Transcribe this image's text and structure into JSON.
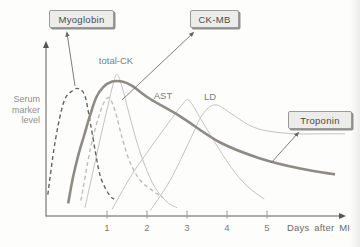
{
  "figure": {
    "background": "#fdfdfb",
    "axis_color": "#5d5d5d",
    "tick_color": "#9b9b9b",
    "tick_text_color": "#7c7c7c",
    "curve_label_color": "#7e7e7e",
    "callout_box_bg": "#ececea",
    "callout_box_border": "#9a9a9a"
  },
  "chart_data": {
    "type": "line",
    "title": "",
    "xlabel": "Days after MI",
    "ylabel": "Serum marker level",
    "x_ticks": [
      "1",
      "2",
      "3",
      "4",
      "5"
    ],
    "x_tick_days": [
      1,
      2,
      3,
      4,
      5
    ],
    "x_range_days": [
      -0.55,
      7.1
    ],
    "y_range_level_pct": [
      0,
      105
    ],
    "grid": false,
    "legend_position": "none",
    "series": [
      {
        "name": "total-CK",
        "style": "thin-solid",
        "color": "#c3c3c3",
        "width": 1,
        "dash": "",
        "inline_label": {
          "text": "total-CK",
          "px": [
            116,
            64
          ]
        },
        "points": [
          [
            0.45,
            5
          ],
          [
            0.65,
            30
          ],
          [
            0.85,
            55
          ],
          [
            1.02,
            75
          ],
          [
            1.15,
            90
          ],
          [
            1.25,
            97
          ],
          [
            1.38,
            88
          ],
          [
            1.55,
            70
          ],
          [
            1.75,
            50
          ],
          [
            1.95,
            34
          ],
          [
            2.2,
            19
          ],
          [
            2.5,
            9
          ],
          [
            2.75,
            5
          ]
        ]
      },
      {
        "name": "AST",
        "style": "thin-solid",
        "color": "#c3c3c3",
        "width": 1,
        "dash": "",
        "inline_label": {
          "text": "AST",
          "px": [
            163,
            99
          ]
        },
        "points": [
          [
            1.13,
            4
          ],
          [
            1.58,
            26
          ],
          [
            2.05,
            45
          ],
          [
            2.55,
            64
          ],
          [
            2.88,
            76
          ],
          [
            3.05,
            79
          ],
          [
            3.35,
            66
          ],
          [
            3.7,
            50
          ],
          [
            4.1,
            33
          ],
          [
            4.5,
            20
          ],
          [
            4.93,
            11
          ]
        ]
      },
      {
        "name": "LD",
        "style": "thin-solid",
        "color": "#c3c3c3",
        "width": 1,
        "dash": "",
        "inline_label": {
          "text": "LD",
          "px": [
            210,
            100
          ]
        },
        "points": [
          [
            2.08,
            3
          ],
          [
            2.58,
            24
          ],
          [
            3.08,
            52
          ],
          [
            3.38,
            69
          ],
          [
            3.7,
            76
          ],
          [
            4.1,
            70
          ],
          [
            4.55,
            62
          ],
          [
            5.0,
            58
          ],
          [
            5.7,
            56
          ],
          [
            6.3,
            56
          ],
          [
            6.95,
            56
          ]
        ]
      },
      {
        "name": "CK-MB",
        "style": "dashed-light",
        "color": "#bcbcbc",
        "width": 1.4,
        "dash": "4 3",
        "points": [
          [
            0.35,
            10
          ],
          [
            0.58,
            45
          ],
          [
            0.83,
            71
          ],
          [
            1.03,
            81
          ],
          [
            1.2,
            72
          ],
          [
            1.38,
            53
          ],
          [
            1.58,
            36
          ],
          [
            1.83,
            24
          ],
          [
            2.13,
            17
          ],
          [
            2.4,
            12
          ]
        ]
      },
      {
        "name": "Myoglobin",
        "style": "dashed-dark",
        "color": "#636363",
        "width": 1.4,
        "dash": "4 3",
        "points": [
          [
            -0.48,
            14
          ],
          [
            -0.3,
            50
          ],
          [
            -0.08,
            78
          ],
          [
            0.15,
            86
          ],
          [
            0.3,
            87
          ],
          [
            0.45,
            82
          ],
          [
            0.58,
            64
          ],
          [
            0.7,
            45
          ],
          [
            0.82,
            28
          ],
          [
            0.95,
            19
          ],
          [
            1.08,
            13
          ],
          [
            1.18,
            11
          ]
        ]
      },
      {
        "name": "Troponin",
        "style": "thick-solid",
        "color": "#8e8a86",
        "width": 2.6,
        "dash": "",
        "points": [
          [
            0.03,
            8
          ],
          [
            0.15,
            26
          ],
          [
            0.28,
            41
          ],
          [
            0.43,
            55
          ],
          [
            0.58,
            69
          ],
          [
            0.73,
            81
          ],
          [
            0.9,
            88
          ],
          [
            1.13,
            92
          ],
          [
            1.38,
            92
          ],
          [
            1.63,
            89
          ],
          [
            2.08,
            80
          ],
          [
            2.83,
            68
          ],
          [
            3.83,
            50
          ],
          [
            4.83,
            39
          ],
          [
            5.83,
            32
          ],
          [
            6.7,
            28
          ]
        ]
      }
    ],
    "callouts": [
      {
        "label": "Myoglobin",
        "box_px": [
          49,
          10,
          65,
          18
        ],
        "arrow_from_px": [
          75,
          86
        ],
        "arrow_to_px": [
          67,
          33
        ]
      },
      {
        "label": "CK-MB",
        "box_px": [
          190,
          10,
          49,
          18
        ],
        "arrow_from_px": [
          122,
          100
        ],
        "arrow_to_px": [
          193,
          33
        ]
      },
      {
        "label": "Troponin",
        "box_px": [
          288,
          111,
          64,
          18
        ],
        "arrow_from_px": [
          271,
          163
        ],
        "arrow_to_px": [
          298,
          133
        ]
      }
    ]
  }
}
